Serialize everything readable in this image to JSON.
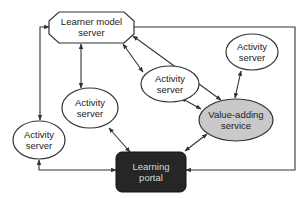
{
  "diagram": {
    "type": "architecture",
    "colors": {
      "line": "#333333",
      "node_fill": "#ffffff",
      "value_adding_fill": "#c9c9c9",
      "portal_fill": "#262626",
      "portal_text": "#d8d8d8"
    },
    "nodes": {
      "learner_model_server": {
        "line1": "Learner model",
        "line2": "server",
        "shape": "octagon"
      },
      "activity_server_top_right": {
        "line1": "Activity",
        "line2": "server",
        "shape": "ellipse"
      },
      "activity_server_middle": {
        "line1": "Activity",
        "line2": "server",
        "shape": "ellipse"
      },
      "activity_server_center_left": {
        "line1": "Activity",
        "line2": "server",
        "shape": "ellipse"
      },
      "activity_server_left": {
        "line1": "Activity",
        "line2": "server",
        "shape": "ellipse"
      },
      "value_adding_service": {
        "line1": "Value-adding",
        "line2": "service",
        "shape": "ellipse-shaded"
      },
      "learning_portal": {
        "line1": "Learning",
        "line2": "portal",
        "shape": "rounded-rect-dark"
      }
    },
    "edges": [
      {
        "from": "learner_model_server",
        "to": "activity_server_center_left",
        "direction": "both"
      },
      {
        "from": "learner_model_server",
        "to": "activity_server_middle",
        "direction": "both"
      },
      {
        "from": "learner_model_server",
        "to": "value_adding_service",
        "direction": "both"
      },
      {
        "from": "learner_model_server",
        "to": "activity_server_left",
        "direction": "both"
      },
      {
        "from": "learner_model_server",
        "to": "learning_portal",
        "direction": "to-portal"
      },
      {
        "from": "activity_server_top_right",
        "to": "value_adding_service",
        "direction": "both"
      },
      {
        "from": "activity_server_middle",
        "to": "value_adding_service",
        "direction": "both"
      },
      {
        "from": "value_adding_service",
        "to": "learning_portal",
        "direction": "both"
      },
      {
        "from": "activity_server_center_left",
        "to": "learning_portal",
        "direction": "both"
      },
      {
        "from": "activity_server_left",
        "to": "learning_portal",
        "direction": "both"
      }
    ]
  }
}
